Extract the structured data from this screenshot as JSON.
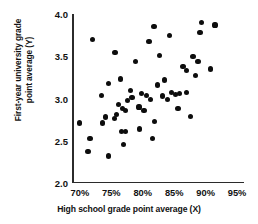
{
  "chart_data": {
    "type": "scatter",
    "title": "",
    "xlabel": "High school grade point average (X)",
    "ylabel_line1": "First-year university grade",
    "ylabel_line2": "point average (Y)",
    "ylabel": "First-year university grade point average (Y)",
    "xlim": [
      68.75,
      96.1
    ],
    "ylim": [
      2.0,
      4.0
    ],
    "xticks": [
      70,
      75,
      80,
      85,
      90,
      95
    ],
    "xticklabels": [
      "70%",
      "75%",
      "80%",
      "85%",
      "90%",
      "95%"
    ],
    "yticks": [
      2.0,
      2.5,
      3.0,
      3.5,
      4.0
    ],
    "yticklabels": [
      "2.0",
      "2.5",
      "3.0",
      "3.5",
      "4.0"
    ],
    "grid": false,
    "legend": false,
    "marker": "filled-circle",
    "marker_color": "#0d0d0d",
    "axis_color": "#2b2b2b",
    "points": [
      {
        "x": 71.3,
        "y": 2.37
      },
      {
        "x": 70.0,
        "y": 2.71
      },
      {
        "x": 71.6,
        "y": 2.53
      },
      {
        "x": 74.5,
        "y": 2.32
      },
      {
        "x": 73.6,
        "y": 2.71
      },
      {
        "x": 74.1,
        "y": 2.78
      },
      {
        "x": 75.5,
        "y": 2.76
      },
      {
        "x": 75.8,
        "y": 2.81
      },
      {
        "x": 76.6,
        "y": 2.61
      },
      {
        "x": 77.2,
        "y": 2.61
      },
      {
        "x": 77.0,
        "y": 2.46
      },
      {
        "x": 79.5,
        "y": 2.64
      },
      {
        "x": 81.6,
        "y": 2.53
      },
      {
        "x": 81.9,
        "y": 2.73
      },
      {
        "x": 85.6,
        "y": 2.88
      },
      {
        "x": 87.6,
        "y": 2.79
      },
      {
        "x": 72.0,
        "y": 3.7
      },
      {
        "x": 73.5,
        "y": 3.04
      },
      {
        "x": 74.5,
        "y": 3.18
      },
      {
        "x": 75.6,
        "y": 3.54
      },
      {
        "x": 76.4,
        "y": 3.23
      },
      {
        "x": 76.1,
        "y": 2.93
      },
      {
        "x": 76.8,
        "y": 2.88
      },
      {
        "x": 77.6,
        "y": 2.98
      },
      {
        "x": 77.2,
        "y": 2.86
      },
      {
        "x": 78.3,
        "y": 3.01
      },
      {
        "x": 78.0,
        "y": 3.09
      },
      {
        "x": 78.8,
        "y": 3.44
      },
      {
        "x": 79.4,
        "y": 2.9
      },
      {
        "x": 79.8,
        "y": 3.06
      },
      {
        "x": 80.2,
        "y": 2.86
      },
      {
        "x": 80.6,
        "y": 3.04
      },
      {
        "x": 81.0,
        "y": 3.67
      },
      {
        "x": 81.2,
        "y": 2.99
      },
      {
        "x": 81.8,
        "y": 3.85
      },
      {
        "x": 82.4,
        "y": 3.16
      },
      {
        "x": 82.7,
        "y": 3.51
      },
      {
        "x": 83.1,
        "y": 3.03
      },
      {
        "x": 83.4,
        "y": 3.22
      },
      {
        "x": 84.0,
        "y": 2.99
      },
      {
        "x": 84.3,
        "y": 3.75
      },
      {
        "x": 84.6,
        "y": 3.07
      },
      {
        "x": 85.2,
        "y": 3.05
      },
      {
        "x": 85.9,
        "y": 3.06
      },
      {
        "x": 86.4,
        "y": 3.38
      },
      {
        "x": 86.9,
        "y": 3.07
      },
      {
        "x": 87.0,
        "y": 3.33
      },
      {
        "x": 88.0,
        "y": 3.5
      },
      {
        "x": 88.4,
        "y": 3.27
      },
      {
        "x": 88.8,
        "y": 3.44
      },
      {
        "x": 89.1,
        "y": 3.78
      },
      {
        "x": 89.4,
        "y": 3.9
      },
      {
        "x": 90.8,
        "y": 3.35
      },
      {
        "x": 91.5,
        "y": 3.87
      }
    ]
  }
}
